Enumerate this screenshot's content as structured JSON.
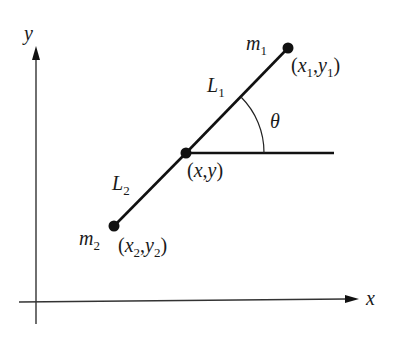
{
  "diagram": {
    "title": "",
    "axes": {
      "x_label": "x",
      "y_label": "y"
    },
    "masses": [
      {
        "name": "m",
        "sub": "1",
        "coord_x": "x",
        "coord_x_sub": "1",
        "coord_y": "y",
        "coord_y_sub": "1"
      },
      {
        "name": "m",
        "sub": "2",
        "coord_x": "x",
        "coord_x_sub": "2",
        "coord_y": "y",
        "coord_y_sub": "2"
      }
    ],
    "lengths": [
      {
        "name": "L",
        "sub": "1"
      },
      {
        "name": "L",
        "sub": "2"
      }
    ],
    "pivot": {
      "label_open": "(",
      "x": "x",
      "comma": ",",
      "y": "y",
      "label_close": ")"
    },
    "angle": {
      "symbol": "θ"
    },
    "punctuation": {
      "open": "(",
      "comma": ",",
      "close": ")"
    },
    "colors": {
      "ink": "#111111",
      "axis": "#333333",
      "background": "#ffffff"
    }
  }
}
